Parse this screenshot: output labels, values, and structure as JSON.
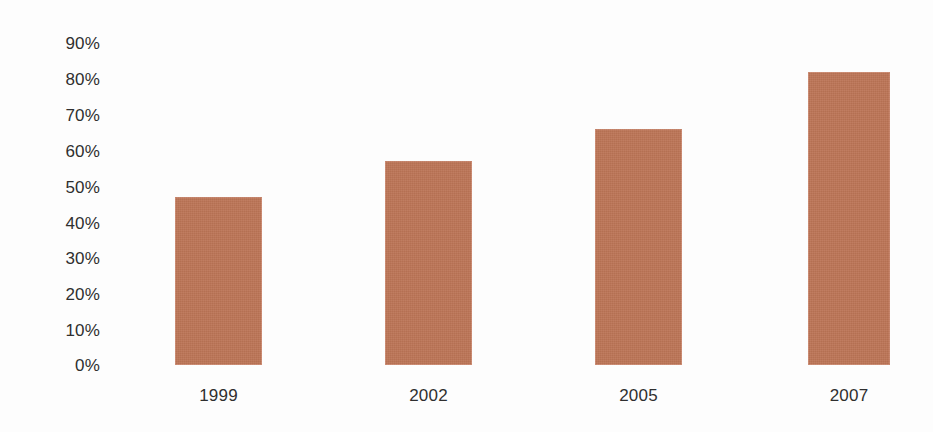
{
  "chart_data": {
    "type": "bar",
    "title": "",
    "subtitle": "",
    "xlabel": "",
    "ylabel": "",
    "categories": [
      "1999",
      "2002",
      "2005",
      "2007"
    ],
    "values": [
      47,
      57,
      66,
      82
    ],
    "ylim": [
      0,
      90
    ],
    "y_ticks": [
      "0%",
      "10%",
      "20%",
      "30%",
      "40%",
      "50%",
      "60%",
      "70%",
      "80%",
      "90%"
    ],
    "y_tick_values": [
      0,
      10,
      20,
      30,
      40,
      50,
      60,
      70,
      80,
      90
    ],
    "value_suffix": "%",
    "grid": false,
    "axis_lines": false,
    "legend": null,
    "legend_position": "none",
    "annotations": [],
    "bar_color": "#bc7456",
    "text_color": "#2f2f2f",
    "background_color": "#fdfdfd"
  }
}
